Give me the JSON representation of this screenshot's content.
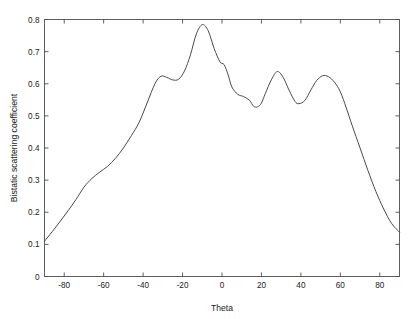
{
  "chart_data": {
    "type": "line",
    "title": "",
    "xlabel": "Theta",
    "ylabel": "Bistatic scattering coefficient",
    "xlim": [
      -90,
      90
    ],
    "ylim": [
      0,
      0.8
    ],
    "xticks": [
      -80,
      -60,
      -40,
      -20,
      0,
      20,
      40,
      60,
      80
    ],
    "xtick_labels": [
      "-80",
      "-60",
      "-40",
      "-20",
      "0",
      "20",
      "40",
      "60",
      "80"
    ],
    "yticks": [
      0,
      0.1,
      0.2,
      0.3,
      0.4,
      0.5,
      0.6,
      0.7,
      0.8
    ],
    "ytick_labels": [
      "0",
      "0.1",
      "0.2",
      "0.3",
      "0.4",
      "0.5",
      "0.6",
      "0.7",
      "0.8"
    ],
    "grid": false,
    "legend": null,
    "line_color": "#4a4a4a",
    "background_color": "#ffffff",
    "series": [
      {
        "name": "Bistatic scattering coefficient",
        "x": [
          -90,
          -86,
          -82,
          -78,
          -74,
          -70,
          -66,
          -62,
          -58,
          -54,
          -50,
          -46,
          -42,
          -38,
          -34,
          -31,
          -28,
          -25,
          -22,
          -19,
          -16,
          -13,
          -10,
          -7,
          -4,
          -1,
          1,
          3,
          5,
          8,
          11,
          14,
          16,
          18,
          20,
          22,
          25,
          28,
          31,
          34,
          37,
          39,
          42,
          45,
          48,
          51,
          54,
          57,
          60,
          63,
          66,
          70,
          74,
          78,
          82,
          86,
          90
        ],
        "y": [
          0.11,
          0.14,
          0.172,
          0.205,
          0.24,
          0.278,
          0.305,
          0.325,
          0.343,
          0.368,
          0.4,
          0.438,
          0.48,
          0.54,
          0.6,
          0.623,
          0.62,
          0.612,
          0.614,
          0.64,
          0.69,
          0.755,
          0.784,
          0.765,
          0.71,
          0.668,
          0.66,
          0.63,
          0.59,
          0.567,
          0.56,
          0.548,
          0.53,
          0.528,
          0.54,
          0.57,
          0.612,
          0.638,
          0.62,
          0.58,
          0.545,
          0.538,
          0.548,
          0.58,
          0.61,
          0.625,
          0.622,
          0.605,
          0.575,
          0.525,
          0.47,
          0.4,
          0.33,
          0.265,
          0.21,
          0.165,
          0.138
        ]
      }
    ],
    "annotations": [
      {
        "label": "main-peak",
        "x": -10,
        "y": 0.784
      },
      {
        "label": "left-shoulder-peak",
        "x": -33,
        "y": 0.625
      },
      {
        "label": "second-peak",
        "x": 25,
        "y": 0.638
      },
      {
        "label": "third-peak",
        "x": 51,
        "y": 0.625
      },
      {
        "label": "first-valley",
        "x": 16,
        "y": 0.528
      },
      {
        "label": "second-valley",
        "x": 39,
        "y": 0.538
      }
    ]
  }
}
